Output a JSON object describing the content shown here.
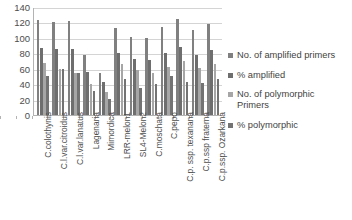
{
  "chart_data": {
    "type": "bar",
    "title": "",
    "subtitle": "",
    "xlabel": "",
    "ylabel": "",
    "ylim": [
      0,
      140
    ],
    "y_ticks": [
      0,
      20,
      40,
      60,
      80,
      100,
      120,
      140
    ],
    "grid": true,
    "legend_position": "right",
    "categories": [
      "C.colothynis",
      "C.l.var.citroidus",
      "C.l.var.lanatus",
      "Lagenaria",
      "Mimordica",
      "LRR-melon1",
      "SL4-Melon2",
      "C.moschata",
      "C.pepo",
      "C.p. ssp. texanana",
      "C.p.ssp fraterna",
      "C.p.ssp. Ozarkana"
    ],
    "series": [
      {
        "name": "No. of amplified primers",
        "color": "#808080",
        "values": [
          123,
          121,
          122,
          78,
          55,
          113,
          101,
          100,
          114,
          124,
          110,
          118
        ]
      },
      {
        "name": "% amplified",
        "color": "#6e6e6e",
        "values": [
          87,
          85,
          86,
          56,
          43,
          80,
          72,
          71,
          81,
          88,
          78,
          84
        ]
      },
      {
        "name": "No. of polymorphic Primers",
        "color": "#a6a6a6",
        "values": [
          68,
          60,
          55,
          40,
          30,
          66,
          58,
          55,
          62,
          70,
          61,
          66
        ]
      },
      {
        "name": "% polymorphic",
        "color": "#737373",
        "values": [
          51,
          60,
          55,
          31,
          21,
          47,
          35,
          40,
          50,
          43,
          42,
          47
        ]
      }
    ],
    "legend": [
      "No. of amplified primers",
      "% amplified",
      "No. of polymorphic Primers",
      "% polymorphic"
    ],
    "legend_colors": [
      "#808080",
      "#6e6e6e",
      "#a6a6a6",
      "#737373"
    ]
  }
}
